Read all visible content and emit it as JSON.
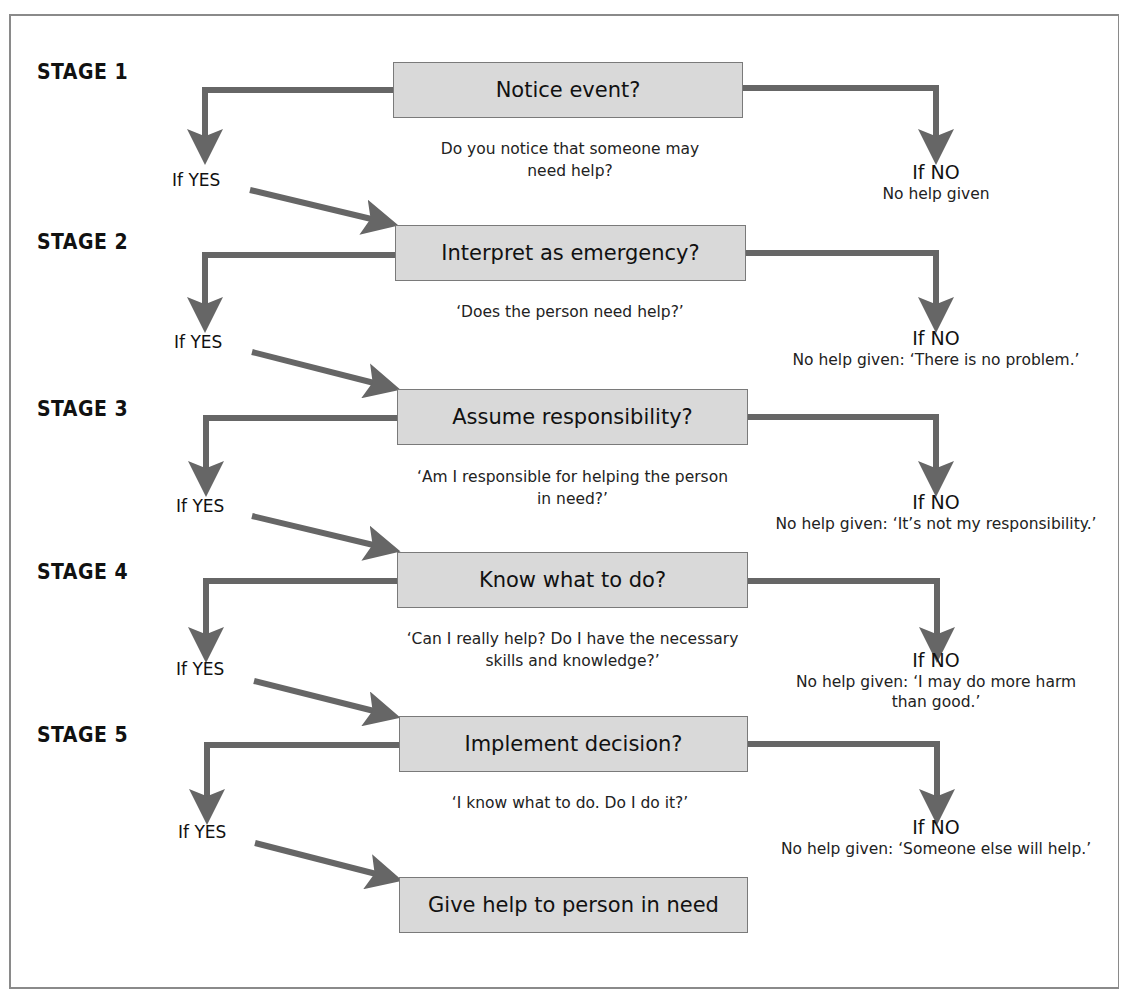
{
  "diagram": {
    "colors": {
      "box_fill": "#d9d9d9",
      "box_border": "#7a7a7a",
      "arrow": "#666666",
      "frame": "#8a8a8a"
    },
    "stages": [
      {
        "label": "STAGE 1",
        "box": "Notice event?",
        "question_lines": [
          "Do you notice that someone may",
          "need help?"
        ],
        "yes_label": "If YES",
        "no_label": "If NO",
        "no_result_lines": [
          "No help given"
        ]
      },
      {
        "label": "STAGE 2",
        "box": "Interpret as emergency?",
        "question_lines": [
          "‘Does the person need help?’"
        ],
        "yes_label": "If YES",
        "no_label": "If NO",
        "no_result_lines": [
          "No help given: ‘There is no problem.’"
        ]
      },
      {
        "label": "STAGE 3",
        "box": "Assume responsibility?",
        "question_lines": [
          "‘Am I responsible for helping the person",
          "in need?’"
        ],
        "yes_label": "If YES",
        "no_label": "If NO",
        "no_result_lines": [
          "No help given: ‘It’s not my responsibility.’"
        ]
      },
      {
        "label": "STAGE 4",
        "box": "Know what to do?",
        "question_lines": [
          "‘Can I really help? Do I have the necessary",
          "skills and knowledge?’"
        ],
        "yes_label": "If YES",
        "no_label": "If NO",
        "no_result_lines": [
          "No help given: ‘I may do more harm",
          "than good.’"
        ]
      },
      {
        "label": "STAGE 5",
        "box": "Implement decision?",
        "question_lines": [
          "‘I know what to do. Do I do it?’"
        ],
        "yes_label": "If YES",
        "no_label": "If NO",
        "no_result_lines": [
          "No help given: ‘Someone else will help.’"
        ]
      }
    ],
    "final_box": "Give help to person in need"
  }
}
